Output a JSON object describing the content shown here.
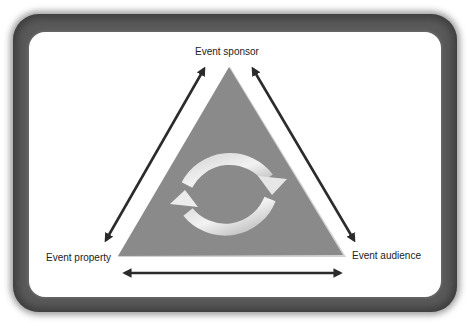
{
  "diagram": {
    "type": "triangle-relationship",
    "nodes": {
      "top": {
        "label": "Event sponsor"
      },
      "bottom_left": {
        "label": "Event property"
      },
      "bottom_right": {
        "label": "Event audience"
      }
    },
    "edges": [
      {
        "from": "Event sponsor",
        "to": "Event property",
        "style": "double-headed-arrow"
      },
      {
        "from": "Event sponsor",
        "to": "Event audience",
        "style": "double-headed-arrow"
      },
      {
        "from": "Event property",
        "to": "Event audience",
        "style": "double-headed-arrow"
      }
    ],
    "center_icon": "cycle-arrows-icon",
    "colors": {
      "triangle_fill": "#8a8a8a",
      "triangle_highlight": "#cfcfcf",
      "arrow": "#2b2b2b",
      "frame": "#5a5a5a",
      "background": "#ffffff"
    }
  }
}
